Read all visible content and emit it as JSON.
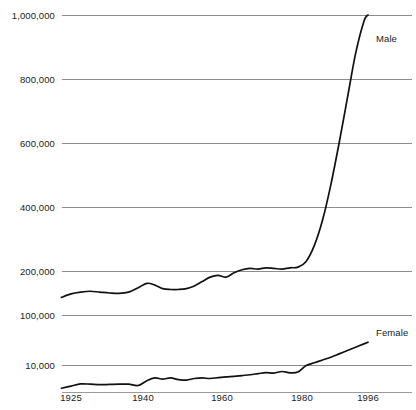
{
  "chart_data": {
    "type": "line",
    "title": "",
    "subtitle": "",
    "xlabel": "",
    "ylabel": "",
    "grid": true,
    "legend_position": "inline-right",
    "axis_note": "Y axis is broken/non-linear: 200,000 to 1,000,000 evenly spaced, then 100,000 and 10,000 compressed below",
    "x_ticks": [
      1925,
      1940,
      1960,
      1980,
      1996
    ],
    "x_tick_labels": [
      "1925",
      "1940",
      "1960",
      "1980",
      "1996"
    ],
    "y_ticks": [
      10000,
      100000,
      200000,
      400000,
      600000,
      800000,
      1000000
    ],
    "y_tick_labels": [
      "10,000",
      "100,000",
      "200,000",
      "400,000",
      "600,000",
      "800,000",
      "1,000,000"
    ],
    "xlim": [
      1923,
      1997
    ],
    "series": [
      {
        "name": "Male",
        "label": "Male",
        "x": [
          1923,
          1925,
          1927,
          1929,
          1931,
          1933,
          1935,
          1937,
          1939,
          1941,
          1943,
          1945,
          1947,
          1949,
          1951,
          1953,
          1955,
          1957,
          1959,
          1961,
          1963,
          1965,
          1967,
          1969,
          1971,
          1973,
          1975,
          1977,
          1979,
          1981,
          1983,
          1985,
          1987,
          1989,
          1991,
          1993,
          1995,
          1996
        ],
        "values": [
          140000,
          148000,
          152000,
          154000,
          152000,
          150000,
          149000,
          152000,
          162000,
          172000,
          168000,
          160000,
          158000,
          158000,
          160000,
          166000,
          176000,
          186000,
          190000,
          186000,
          196000,
          204000,
          208000,
          206000,
          210000,
          208000,
          206000,
          210000,
          212000,
          230000,
          280000,
          360000,
          470000,
          600000,
          740000,
          880000,
          980000,
          1000000
        ]
      },
      {
        "name": "Female",
        "label": "Female",
        "x": [
          1923,
          1925,
          1927,
          1929,
          1931,
          1933,
          1935,
          1937,
          1939,
          1941,
          1943,
          1945,
          1947,
          1949,
          1951,
          1953,
          1955,
          1957,
          1959,
          1961,
          1963,
          1965,
          1967,
          1969,
          1971,
          1973,
          1975,
          1977,
          1979,
          1981,
          1983,
          1985,
          1987,
          1989,
          1991,
          1993,
          1995,
          1996
        ],
        "values": [
          1400,
          2200,
          3000,
          2900,
          2700,
          2800,
          2900,
          2900,
          2400,
          4200,
          5200,
          4800,
          5200,
          4600,
          4400,
          5000,
          5200,
          5000,
          5300,
          5600,
          5800,
          6100,
          6400,
          6800,
          7200,
          7000,
          7600,
          7100,
          7400,
          9800,
          14000,
          19000,
          24000,
          30000,
          36000,
          42000,
          48000,
          51000
        ]
      }
    ],
    "colors": {
      "line": "#111111",
      "grid": "#8c8c8c",
      "text": "#1a1a1a",
      "background": "#ffffff"
    }
  },
  "y_axis": {
    "ticks": [
      {
        "label": "1,000,000",
        "y": 15
      },
      {
        "label": "800,000",
        "y": 79
      },
      {
        "label": "600,000",
        "y": 143
      },
      {
        "label": "400,000",
        "y": 207
      },
      {
        "label": "200,000",
        "y": 271
      },
      {
        "label": "100,000",
        "y": 315
      },
      {
        "label": "10,000",
        "y": 365
      }
    ],
    "baseline_y": 392
  },
  "x_axis": {
    "ticks": [
      {
        "label": "1925",
        "x": 71
      },
      {
        "label": "1940",
        "x": 143
      },
      {
        "label": "1960",
        "x": 222
      },
      {
        "label": "1980",
        "x": 302
      },
      {
        "label": "1996",
        "x": 368
      }
    ]
  },
  "series_labels": [
    {
      "name": "Male",
      "x": 376,
      "y": 33
    },
    {
      "name": "Female",
      "x": 376,
      "y": 327
    }
  ]
}
